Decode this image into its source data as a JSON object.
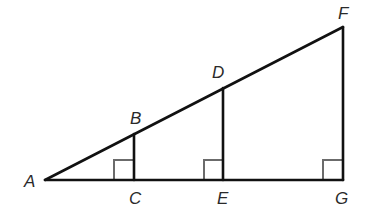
{
  "diagram": {
    "type": "geometry",
    "colors": {
      "line": "#111111",
      "right_angle_marker": "#6b6b6b",
      "label": "#2a2a2a",
      "background": "#ffffff"
    },
    "points": {
      "A": {
        "label": "A",
        "x": 45,
        "y": 180
      },
      "B": {
        "label": "B",
        "x": 134,
        "y": 134
      },
      "C": {
        "label": "C",
        "x": 134,
        "y": 180
      },
      "D": {
        "label": "D",
        "x": 223,
        "y": 88
      },
      "E": {
        "label": "E",
        "x": 223,
        "y": 180
      },
      "F": {
        "label": "F",
        "x": 343,
        "y": 27
      },
      "G": {
        "label": "G",
        "x": 343,
        "y": 180
      }
    },
    "segments": [
      {
        "from": "A",
        "to": "F"
      },
      {
        "from": "A",
        "to": "G"
      },
      {
        "from": "B",
        "to": "C"
      },
      {
        "from": "D",
        "to": "E"
      },
      {
        "from": "F",
        "to": "G"
      }
    ],
    "right_angles": [
      {
        "vertex": "C"
      },
      {
        "vertex": "E"
      },
      {
        "vertex": "G"
      }
    ],
    "labels": {
      "A": "A",
      "B": "B",
      "C": "C",
      "D": "D",
      "E": "E",
      "F": "F",
      "G": "G"
    }
  }
}
